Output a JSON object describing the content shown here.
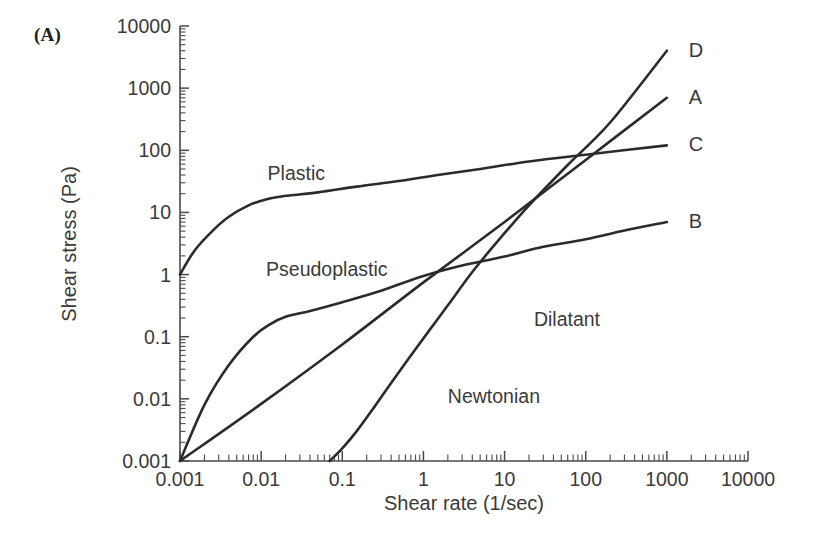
{
  "panel": {
    "label": "(A)"
  },
  "chart_data": {
    "type": "line",
    "title": "",
    "xlabel": "Shear rate (1/sec)",
    "ylabel": "Shear stress (Pa)",
    "xscale": "log",
    "yscale": "log",
    "xlim": [
      0.001,
      10000
    ],
    "ylim": [
      0.001,
      10000
    ],
    "xticks": [
      "0.001",
      "0.01",
      "0.1",
      "1",
      "10",
      "100",
      "1000",
      "10000"
    ],
    "yticks": [
      "0.001",
      "0.01",
      "0.1",
      "1",
      "10",
      "100",
      "1000",
      "10000"
    ],
    "grid": false,
    "legend_position": "right-inline",
    "series": [
      {
        "name": "A",
        "label": "Newtonian",
        "label_x": 2.0,
        "label_y": 0.0085,
        "end_label": "A",
        "points": [
          [
            0.001,
            0.001
          ],
          [
            0.01,
            0.0083
          ],
          [
            0.1,
            0.075
          ],
          [
            1,
            0.75
          ],
          [
            10,
            7.0
          ],
          [
            100,
            70
          ],
          [
            1000,
            700
          ]
        ]
      },
      {
        "name": "B",
        "label": "Pseudoplastic",
        "label_x": 0.0115,
        "label_y": 0.95,
        "end_label": "B",
        "points": [
          [
            0.001,
            0.001
          ],
          [
            0.002,
            0.008
          ],
          [
            0.004,
            0.035
          ],
          [
            0.008,
            0.1
          ],
          [
            0.013,
            0.16
          ],
          [
            0.02,
            0.21
          ],
          [
            0.04,
            0.26
          ],
          [
            0.1,
            0.36
          ],
          [
            0.3,
            0.55
          ],
          [
            1,
            0.95
          ],
          [
            3,
            1.4
          ],
          [
            10,
            1.95
          ],
          [
            30,
            2.8
          ],
          [
            100,
            3.7
          ],
          [
            300,
            5.1
          ],
          [
            1000,
            7.0
          ]
        ]
      },
      {
        "name": "C",
        "label": "Plastic",
        "label_x": 0.012,
        "label_y": 33,
        "end_label": "C",
        "points": [
          [
            0.001,
            1.0
          ],
          [
            0.0015,
            2.4
          ],
          [
            0.0025,
            5.0
          ],
          [
            0.004,
            8.5
          ],
          [
            0.007,
            13
          ],
          [
            0.012,
            16.5
          ],
          [
            0.02,
            18.5
          ],
          [
            0.05,
            21
          ],
          [
            0.15,
            26
          ],
          [
            0.5,
            32
          ],
          [
            1.5,
            40
          ],
          [
            5,
            50
          ],
          [
            20,
            66
          ],
          [
            100,
            85
          ],
          [
            1000,
            120
          ]
        ]
      },
      {
        "name": "D",
        "label": "Dilatant",
        "label_x": 23,
        "label_y": 0.15,
        "end_label": "D",
        "points": [
          [
            0.07,
            0.001
          ],
          [
            0.1,
            0.0016
          ],
          [
            0.15,
            0.003
          ],
          [
            0.25,
            0.0075
          ],
          [
            0.4,
            0.018
          ],
          [
            0.7,
            0.05
          ],
          [
            1.2,
            0.13
          ],
          [
            2,
            0.32
          ],
          [
            4,
            1.1
          ],
          [
            8,
            3.3
          ],
          [
            20,
            13
          ],
          [
            60,
            58
          ],
          [
            200,
            280
          ],
          [
            1000,
            4000
          ]
        ]
      }
    ]
  }
}
